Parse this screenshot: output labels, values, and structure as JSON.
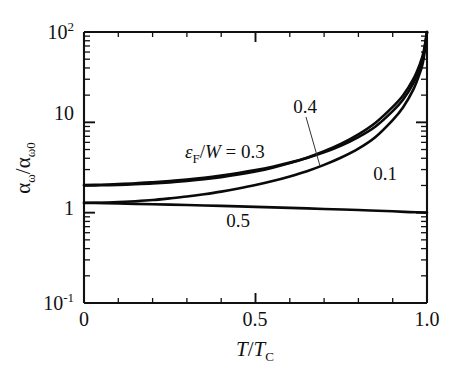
{
  "figure": {
    "background_color": "#ffffff",
    "line_color": "#0a0a0a"
  },
  "axes": {
    "x": {
      "label_main": "T",
      "label_slash": "/",
      "label_denom": "T",
      "label_denom_sub": "C",
      "label_plain": "T/TC",
      "ticks": [
        "0",
        "0.5",
        "1.0"
      ],
      "tick_values": [
        0,
        0.5,
        1.0
      ],
      "min": 0,
      "max": 1.0,
      "scale": "linear",
      "minor_ticks": [
        0.1,
        0.2,
        0.3,
        0.4,
        0.6,
        0.7,
        0.8,
        0.9
      ]
    },
    "y": {
      "label_num": "α",
      "label_num_sub": "ω",
      "label_slash": "/",
      "label_den": "α",
      "label_den_sub": "ω0",
      "label_plain": "αω/αω0",
      "ticks": [
        "10",
        "10",
        "1",
        "10"
      ],
      "tick_top": "10",
      "tick_top_exp": "2",
      "tick_mid_upper": "10",
      "tick_mid_lower": "1",
      "tick_bottom": "10",
      "tick_bottom_exp": "-1",
      "min": 0.1,
      "max": 100,
      "scale": "log"
    }
  },
  "annotations": {
    "legend_prefix_eps": "ε",
    "legend_prefix_sub": "F",
    "legend_prefix_slash": "/",
    "legend_prefix_w": "W",
    "legend_prefix_eq": " = 0.3",
    "legend_full": "εF/W = 0.3",
    "label_04": "0.4",
    "label_01": "0.1",
    "label_05": "0.5"
  },
  "chart_data": {
    "type": "line",
    "title": "",
    "xlabel": "T/TC",
    "ylabel": "αω/αω0",
    "xlim": [
      0,
      1.0
    ],
    "ylim": [
      0.1,
      100
    ],
    "yscale": "log",
    "xscale": "linear",
    "grid": false,
    "legend_position": "inline-annotations",
    "legend_parameter": "εF/W",
    "series": [
      {
        "name": "0.1",
        "eps_over_W": 0.1,
        "x": [
          0.0,
          0.05,
          0.1,
          0.15,
          0.2,
          0.25,
          0.3,
          0.35,
          0.4,
          0.45,
          0.5,
          0.55,
          0.6,
          0.65,
          0.7,
          0.75,
          0.8,
          0.85,
          0.9,
          0.93,
          0.96,
          0.98,
          0.99,
          1.0
        ],
        "y": [
          1.28,
          1.29,
          1.31,
          1.34,
          1.38,
          1.44,
          1.51,
          1.6,
          1.71,
          1.85,
          2.02,
          2.24,
          2.52,
          2.88,
          3.38,
          4.08,
          5.12,
          6.9,
          10.6,
          14.6,
          23.0,
          36.0,
          50.0,
          100.0
        ]
      },
      {
        "name": "0.3",
        "eps_over_W": 0.3,
        "x": [
          0.0,
          0.05,
          0.1,
          0.15,
          0.2,
          0.25,
          0.3,
          0.35,
          0.4,
          0.45,
          0.5,
          0.55,
          0.6,
          0.65,
          0.7,
          0.75,
          0.8,
          0.85,
          0.9,
          0.93,
          0.96,
          0.98,
          0.99,
          1.0
        ],
        "y": [
          2.02,
          2.04,
          2.07,
          2.11,
          2.17,
          2.24,
          2.33,
          2.44,
          2.58,
          2.75,
          2.96,
          3.23,
          3.58,
          4.03,
          4.65,
          5.52,
          6.85,
          9.0,
          13.3,
          17.8,
          27.0,
          41.0,
          56.0,
          100.0
        ]
      },
      {
        "name": "0.4",
        "eps_over_W": 0.4,
        "x": [
          0.0,
          0.05,
          0.1,
          0.15,
          0.2,
          0.25,
          0.3,
          0.35,
          0.4,
          0.45,
          0.5,
          0.55,
          0.6,
          0.65,
          0.7,
          0.75,
          0.8,
          0.85,
          0.9,
          0.93,
          0.96,
          0.98,
          0.99,
          1.0
        ],
        "y": [
          2.0,
          2.01,
          2.03,
          2.06,
          2.1,
          2.16,
          2.24,
          2.34,
          2.47,
          2.64,
          2.86,
          3.15,
          3.54,
          4.06,
          4.78,
          5.8,
          7.35,
          9.9,
          14.8,
          19.8,
          30.0,
          45.0,
          60.0,
          100.0
        ]
      },
      {
        "name": "0.5",
        "eps_over_W": 0.5,
        "x": [
          0.0,
          0.1,
          0.2,
          0.3,
          0.4,
          0.5,
          0.6,
          0.7,
          0.8,
          0.9,
          0.95,
          1.0
        ],
        "y": [
          1.29,
          1.265,
          1.24,
          1.215,
          1.19,
          1.16,
          1.13,
          1.1,
          1.07,
          1.035,
          1.015,
          1.0
        ]
      }
    ]
  }
}
